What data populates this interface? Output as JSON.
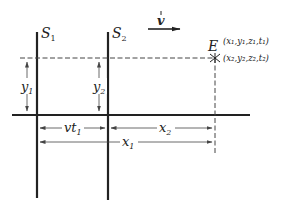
{
  "frames": {
    "s1": {
      "label": "S",
      "sub": "1"
    },
    "s2": {
      "label": "S",
      "sub": "2"
    }
  },
  "velocity": {
    "label": "v"
  },
  "event": {
    "label": "E",
    "coords_s1": "(x₁,y₁,z₁,t₁)",
    "coords_s2": "(x₂,y₂,z₂,t₂)"
  },
  "dimensions": {
    "y1": {
      "label": "y",
      "sub": "1"
    },
    "y2": {
      "label": "y",
      "sub": "2"
    },
    "vt1": {
      "label": "vt",
      "sub": "1"
    },
    "x2": {
      "label": "x",
      "sub": "2"
    },
    "x1": {
      "label": "x",
      "sub": "1"
    }
  },
  "colors": {
    "ink": "#222222",
    "dim": "#555555",
    "background": "#ffffff"
  }
}
